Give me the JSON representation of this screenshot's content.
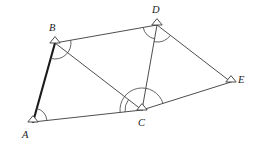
{
  "figure": {
    "background_color": "#ffffff",
    "line_color": "#3a3a3a",
    "emphasis_color": "#1a1a1a",
    "label_color": "#1d1d1d",
    "vertices": [
      {
        "id": "A",
        "label": "A",
        "x": 33,
        "y": 122,
        "label_x": 22,
        "label_y": 138
      },
      {
        "id": "B",
        "label": "B",
        "x": 55,
        "y": 43,
        "label_x": 49,
        "label_y": 31
      },
      {
        "id": "C",
        "label": "C",
        "x": 142,
        "y": 110,
        "label_x": 138,
        "label_y": 126
      },
      {
        "id": "D",
        "label": "D",
        "x": 157,
        "y": 25,
        "label_x": 152,
        "label_y": 13
      },
      {
        "id": "E",
        "label": "E",
        "x": 231,
        "y": 82,
        "label_x": 238,
        "label_y": 83
      }
    ],
    "segments": [
      {
        "from": "A",
        "to": "B",
        "emphasis": true
      },
      {
        "from": "B",
        "to": "D",
        "emphasis": false
      },
      {
        "from": "B",
        "to": "C",
        "emphasis": false
      },
      {
        "from": "D",
        "to": "C",
        "emphasis": false
      },
      {
        "from": "D",
        "to": "E",
        "emphasis": false
      },
      {
        "from": "A",
        "to": "C",
        "emphasis": false
      },
      {
        "from": "C",
        "to": "E",
        "emphasis": false
      }
    ],
    "angle_marks": [
      {
        "vertex": "A",
        "from": "B",
        "to": "C",
        "radius": 14
      },
      {
        "vertex": "B",
        "from": "D",
        "to": "A",
        "radius": 16
      },
      {
        "vertex": "C",
        "from": "A",
        "to": "B",
        "radius": 17
      },
      {
        "vertex": "C",
        "from": "A",
        "to": "E",
        "radius": 22
      },
      {
        "vertex": "D",
        "from": "B",
        "to": "C",
        "radius": 14
      },
      {
        "vertex": "D",
        "from": "C",
        "to": "E",
        "radius": 17
      }
    ]
  }
}
